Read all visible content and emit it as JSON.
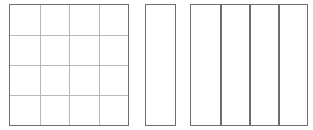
{
  "diagram": {
    "colors": {
      "outline": "#6e6e6e",
      "grid": "#b8b8b8",
      "fill": "#ffffff"
    },
    "shapes": [
      {
        "id": "grid-square",
        "rows": 4,
        "cols": 4,
        "x": 9,
        "y": 4,
        "w": 120,
        "h": 122
      },
      {
        "id": "single-strip",
        "rows": 1,
        "cols": 1,
        "x": 145,
        "y": 4,
        "w": 31,
        "h": 122
      },
      {
        "id": "strip-square",
        "rows": 1,
        "cols": 4,
        "x": 190,
        "y": 4,
        "w": 118,
        "h": 122
      }
    ]
  }
}
